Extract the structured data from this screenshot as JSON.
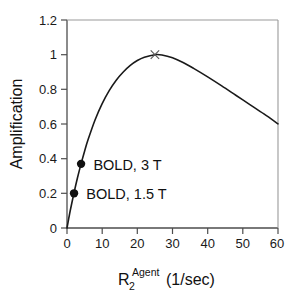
{
  "chart_data": {
    "type": "line",
    "title": "",
    "xlabel_base": "R",
    "xlabel_subscript": "2",
    "xlabel_superscript": "Agent",
    "xlabel_units": "(1/sec)",
    "ylabel": "Amplification",
    "xlim": [
      0,
      60
    ],
    "ylim": [
      0,
      1.2
    ],
    "grid": false,
    "legend": "none",
    "x_ticks": [
      0,
      10,
      20,
      30,
      40,
      50,
      60
    ],
    "x_tick_labels": [
      "0",
      "10",
      "20",
      "30",
      "40",
      "50",
      "60"
    ],
    "y_ticks": [
      0,
      0.2,
      0.4,
      0.6,
      0.8,
      1,
      1.2
    ],
    "y_tick_labels": [
      "0",
      "0.2",
      "0.4",
      "0.6",
      "0.8",
      "1",
      "1.2"
    ],
    "series": [
      {
        "name": "amplification-curve",
        "color": "#1a1a1a",
        "x": [
          0,
          0.5,
          1,
          2,
          3,
          4,
          5,
          6,
          8,
          10,
          12,
          14,
          16,
          18,
          20,
          22,
          25,
          27,
          30,
          33,
          36,
          40,
          44,
          48,
          52,
          56,
          60
        ],
        "y": [
          0,
          0.055,
          0.108,
          0.203,
          0.291,
          0.37,
          0.443,
          0.51,
          0.625,
          0.718,
          0.793,
          0.853,
          0.9,
          0.938,
          0.966,
          0.985,
          1.0,
          0.998,
          0.982,
          0.955,
          0.921,
          0.872,
          0.82,
          0.766,
          0.712,
          0.658,
          0.601
        ]
      }
    ],
    "markers": [
      {
        "name": "bold-3t-marker",
        "label": "BOLD, 3 T",
        "shape": "filled-circle",
        "x": 4,
        "y": 0.37,
        "color": "#111111"
      },
      {
        "name": "bold-15t-marker",
        "label": "BOLD, 1.5 T",
        "shape": "filled-circle",
        "x": 2,
        "y": 0.2,
        "color": "#111111"
      },
      {
        "name": "peak-marker",
        "label": "",
        "shape": "cross-x",
        "x": 25,
        "y": 1.0,
        "color": "#555555"
      }
    ],
    "annotations": [
      {
        "name": "bold-3t-annotation",
        "text": "BOLD, 3 T",
        "x": 7.5,
        "y": 0.365
      },
      {
        "name": "bold-15t-annotation",
        "text": "BOLD, 1.5 T",
        "x": 5.5,
        "y": 0.195
      }
    ]
  }
}
